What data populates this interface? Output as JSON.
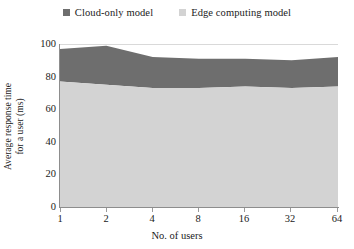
{
  "chart_data": {
    "type": "area",
    "stacked": true,
    "title": "",
    "xlabel": "No. of users",
    "ylabel": "Average response time for a user (ms)",
    "ylabel_lines": [
      "Average response time",
      "for a user (ms)"
    ],
    "categories": [
      "1",
      "2",
      "4",
      "8",
      "16",
      "32",
      "64"
    ],
    "x": [
      1,
      2,
      4,
      8,
      16,
      32,
      64
    ],
    "ylim": [
      0,
      100
    ],
    "yticks": [
      0,
      20,
      40,
      60,
      80,
      100
    ],
    "ytick_labels": [
      "0",
      "20",
      "40",
      "60",
      "80",
      "100"
    ],
    "grid": false,
    "legend_position": "top-center",
    "series": [
      {
        "name": "Edge computing model",
        "color": "#d3d3d3",
        "values": [
          77,
          75,
          73,
          73,
          74,
          73,
          74
        ]
      },
      {
        "name": "Cloud-only model",
        "color": "#6e6e6e",
        "values": [
          20,
          24,
          19,
          18,
          17,
          17,
          18
        ],
        "cumulative_top": [
          97,
          99,
          92,
          91,
          91,
          90,
          92
        ]
      }
    ]
  },
  "legend": {
    "items": [
      {
        "label": "Cloud-only model",
        "color": "#6e6e6e",
        "swatch_icon": "square-swatch-icon"
      },
      {
        "label": "Edge computing model",
        "color": "#d3d3d3",
        "swatch_icon": "square-swatch-icon"
      }
    ]
  },
  "axes": {
    "y_title_line1": "Average response time",
    "y_title_line2": "for a user (ms)",
    "x_title": "No. of users",
    "y_ticks": [
      "100",
      "80",
      "60",
      "40",
      "20",
      "0"
    ],
    "x_ticks": [
      "1",
      "2",
      "4",
      "8",
      "16",
      "32",
      "64"
    ]
  },
  "colors": {
    "cloud_only": "#6e6e6e",
    "edge_computing": "#d3d3d3",
    "axis": "#8d8d8d",
    "text": "#1a1a1a",
    "background": "#ffffff"
  }
}
